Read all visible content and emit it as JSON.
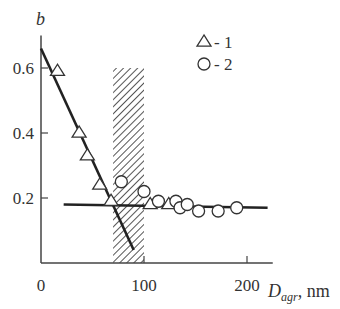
{
  "chart_data": {
    "type": "scatter",
    "title": "",
    "ylabel": "b",
    "xlabel_main": "D",
    "xlabel_sub": "agr",
    "xlabel_unit": ", nm",
    "xlim": [
      0,
      225
    ],
    "ylim": [
      0,
      0.7
    ],
    "x_ticks": [
      0,
      100,
      200
    ],
    "x_tick_labels": [
      "0",
      "100",
      "200"
    ],
    "y_ticks": [
      0.2,
      0.4,
      0.6
    ],
    "y_tick_labels": [
      "0.2",
      "0.4",
      "0.6"
    ],
    "grid": false,
    "legend_position": "upper right",
    "legend": [
      {
        "marker": "triangle",
        "label": "- 1"
      },
      {
        "marker": "circle",
        "label": "- 2"
      }
    ],
    "shaded_band": {
      "x_from": 70,
      "x_to": 100,
      "y_to": 0.6,
      "style": "hatched"
    },
    "series": [
      {
        "name": "1",
        "marker": "triangle",
        "points": [
          [
            16,
            0.59
          ],
          [
            37,
            0.4
          ],
          [
            45,
            0.33
          ],
          [
            57,
            0.24
          ],
          [
            68,
            0.19
          ],
          [
            106,
            0.18
          ],
          [
            124,
            0.18
          ]
        ]
      },
      {
        "name": "2",
        "marker": "circle",
        "points": [
          [
            78,
            0.25
          ],
          [
            100,
            0.22
          ],
          [
            114,
            0.19
          ],
          [
            131,
            0.19
          ],
          [
            135,
            0.17
          ],
          [
            142,
            0.18
          ],
          [
            153,
            0.16
          ],
          [
            172,
            0.16
          ],
          [
            190,
            0.17
          ]
        ]
      }
    ],
    "fit_lines": [
      {
        "name": "steep",
        "from": [
          0,
          0.66
        ],
        "to": [
          90,
          0.04
        ]
      },
      {
        "name": "flat",
        "from": [
          22,
          0.18
        ],
        "to": [
          220,
          0.17
        ]
      }
    ]
  }
}
